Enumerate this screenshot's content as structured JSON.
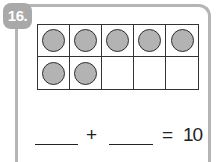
{
  "problem": {
    "number_label": "16.",
    "ten_frame": {
      "rows": 2,
      "columns": 5,
      "filled_cells": 7,
      "cells": [
        [
          true,
          true,
          true,
          true,
          true
        ],
        [
          true,
          true,
          false,
          false,
          false
        ]
      ],
      "counter_color": "#b3b3b3"
    },
    "equation": {
      "blank1": "",
      "plus": "+",
      "blank2": "",
      "equals": "=",
      "result": "10"
    }
  },
  "colors": {
    "badge": "#a9a9a9",
    "border": "#b5b5b5",
    "grid_line": "#333333"
  }
}
